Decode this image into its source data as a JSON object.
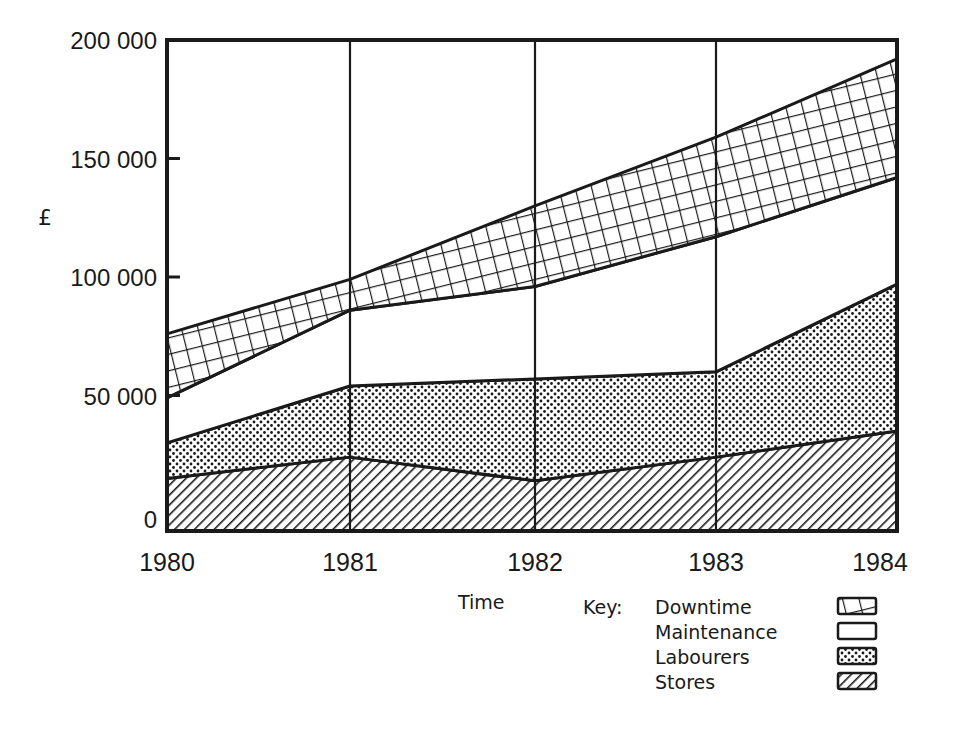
{
  "chart_data": {
    "type": "area",
    "stacked": true,
    "title": "",
    "xlabel": "Time",
    "ylabel": "£",
    "x": [
      "1980",
      "1981",
      "1982",
      "1983",
      "1984"
    ],
    "ylim": [
      0,
      200000
    ],
    "yticks": [
      "200 000",
      "150 000",
      "100 000",
      "50 000",
      "0"
    ],
    "grid": "vertical lines at each year",
    "legend_title": "Key:",
    "legend_position": "bottom-right",
    "series": [
      {
        "name": "Stores",
        "pattern": "diagonal-hatch",
        "values": [
          15000,
          24000,
          14000,
          24000,
          35000
        ]
      },
      {
        "name": "Labourers",
        "pattern": "dots",
        "values": [
          15000,
          30000,
          43000,
          36000,
          62000
        ]
      },
      {
        "name": "Maintenance",
        "pattern": "blank",
        "values": [
          19000,
          32000,
          39000,
          57000,
          45000
        ]
      },
      {
        "name": "Downtime",
        "pattern": "grid-crosshatch",
        "values": [
          27000,
          13000,
          34000,
          42000,
          50000
        ]
      }
    ],
    "cumulative_tops": {
      "Stores": [
        15000,
        24000,
        14000,
        24000,
        35000
      ],
      "Labourers": [
        30000,
        54000,
        57000,
        60000,
        97000
      ],
      "Maintenance": [
        49000,
        86000,
        96000,
        117000,
        142000
      ],
      "Downtime": [
        76000,
        99000,
        130000,
        159000,
        192000
      ]
    }
  },
  "labels": {
    "y_axis_symbol": "£",
    "x_axis_title": "Time",
    "key_title": "Key:",
    "yticks": [
      "200 000",
      "150 000",
      "100 000",
      "50 000",
      "0"
    ],
    "years": [
      "1980",
      "1981",
      "1982",
      "1983",
      "1984"
    ],
    "legend": [
      "Downtime",
      "Maintenance",
      "Labourers",
      "Stores"
    ]
  }
}
